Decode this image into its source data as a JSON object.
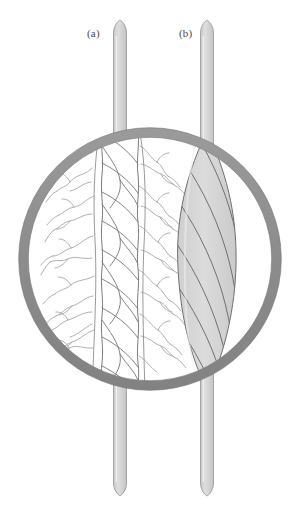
{
  "figure": {
    "background_color": "#ffffff",
    "width": 300,
    "height": 514,
    "labels": [
      {
        "id": "a",
        "text": "(a)",
        "x": 87,
        "y": 27,
        "refers_to": "spun-staple-yarn"
      },
      {
        "id": "b",
        "text": "(b)",
        "x": 179,
        "y": 27,
        "refers_to": "filament-yarn"
      }
    ],
    "magnifier": {
      "name": "magnifying-lens-ring",
      "center_x": 150,
      "center_y": 259,
      "outer_radius": 131,
      "ring_thickness": 10,
      "ring_color": "#8f8f8f",
      "ring_stroke_color": "#6e6e6e",
      "lens_fill": "#ffffff"
    },
    "strands": [
      {
        "name": "strand-a-unmagnified",
        "label_id": "a",
        "kind": "spun-staple-yarn",
        "center_x": 120,
        "width": 13,
        "top_y": 20,
        "bottom_y": 496,
        "fill_color": "#d9d9d9",
        "stroke_color": "#9a9a9a",
        "tip_shape": "rounded-pointed"
      },
      {
        "name": "strand-b-unmagnified",
        "label_id": "b",
        "kind": "continuous-filament-yarn",
        "center_x": 207,
        "width": 13,
        "top_y": 20,
        "bottom_y": 496,
        "fill_color": "#d9d9d9",
        "stroke_color": "#9a9a9a",
        "tip_shape": "rounded-pointed"
      }
    ],
    "magnified_views": [
      {
        "name": "magnified-spun-staple-yarn",
        "label_id": "a",
        "description": "Twisted spun yarn with many protruding staple fibre ends (hairiness)",
        "core_fill": "#ffffff",
        "line_color": "#7c7c7c",
        "hair_color": "#9e9e9e",
        "twist_turns": 9,
        "hairiness": "high"
      },
      {
        "name": "magnified-filament-yarn",
        "label_id": "b",
        "description": "Smooth lens-shaped bundle of continuous filaments with helical twist lines, no protruding ends",
        "body_fill": "#d8d8d8",
        "line_color": "#6a6a6a",
        "twist_lines": 7,
        "hairiness": "none"
      }
    ]
  }
}
